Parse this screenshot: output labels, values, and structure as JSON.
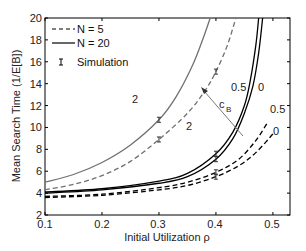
{
  "chart_data": {
    "type": "line",
    "title": "",
    "xlabel": "Initial Utilization ρ",
    "ylabel": "Mean Search Time (1/E[B])",
    "xlim": [
      0.1,
      0.53
    ],
    "ylim": [
      2,
      20
    ],
    "xticks": [
      "0.1",
      "0.2",
      "0.3",
      "0.4",
      "0.5"
    ],
    "yticks": [
      "2",
      "4",
      "6",
      "8",
      "10",
      "12",
      "14",
      "16",
      "18",
      "20"
    ],
    "grid": false,
    "legend_position": "upper left",
    "legend": [
      {
        "label": "N = 5",
        "style": "dashed"
      },
      {
        "label": "N = 20",
        "style": "solid"
      },
      {
        "label": "Simulation",
        "style": "errorbar"
      }
    ],
    "series": [
      {
        "name": "N = 20, cB = 2",
        "style": "solid",
        "color": "#707070",
        "x": [
          0.1,
          0.15,
          0.2,
          0.25,
          0.3,
          0.33,
          0.36,
          0.38,
          0.39
        ],
        "y": [
          5.0,
          5.7,
          6.8,
          8.4,
          10.7,
          12.8,
          15.8,
          18.5,
          20
        ]
      },
      {
        "name": "N = 5, cB = 2",
        "style": "dashed",
        "color": "#707070",
        "x": [
          0.1,
          0.15,
          0.2,
          0.25,
          0.3,
          0.35,
          0.38,
          0.4,
          0.42,
          0.435
        ],
        "y": [
          4.3,
          4.8,
          5.6,
          6.9,
          8.9,
          11.3,
          13.3,
          15.1,
          17.5,
          20
        ]
      },
      {
        "name": "N = 20, cB = 0.5",
        "style": "solid",
        "color": "#000000",
        "x": [
          0.1,
          0.2,
          0.3,
          0.35,
          0.4,
          0.43,
          0.45,
          0.46,
          0.47,
          0.475
        ],
        "y": [
          4.1,
          4.4,
          5.1,
          5.8,
          7.6,
          9.6,
          12.0,
          14.2,
          17.5,
          20
        ]
      },
      {
        "name": "N = 20, cB = 0",
        "style": "solid",
        "color": "#000000",
        "x": [
          0.1,
          0.2,
          0.3,
          0.35,
          0.4,
          0.43,
          0.45,
          0.465,
          0.475,
          0.482
        ],
        "y": [
          4.0,
          4.3,
          4.9,
          5.5,
          7.1,
          9.0,
          11.3,
          13.8,
          16.8,
          20
        ]
      },
      {
        "name": "N = 5, cB = 0.5",
        "style": "dashed",
        "color": "#000000",
        "x": [
          0.1,
          0.2,
          0.3,
          0.35,
          0.4,
          0.44,
          0.47,
          0.49
        ],
        "y": [
          3.7,
          3.9,
          4.5,
          5.0,
          5.9,
          7.1,
          8.8,
          10.4
        ]
      },
      {
        "name": "N = 5, cB = 0",
        "style": "dashed",
        "color": "#000000",
        "x": [
          0.1,
          0.2,
          0.3,
          0.35,
          0.4,
          0.44,
          0.47,
          0.5
        ],
        "y": [
          3.6,
          3.8,
          4.3,
          4.7,
          5.5,
          6.5,
          7.7,
          9.4
        ]
      }
    ],
    "simulation_points": [
      {
        "x": 0.3,
        "y": 10.7
      },
      {
        "x": 0.3,
        "y": 8.9
      },
      {
        "x": 0.4,
        "y": 15.1
      },
      {
        "x": 0.4,
        "y": 7.6
      },
      {
        "x": 0.4,
        "y": 7.1
      },
      {
        "x": 0.4,
        "y": 5.9
      },
      {
        "x": 0.4,
        "y": 5.5
      }
    ],
    "annotations": [
      {
        "text": "2",
        "x": 0.26,
        "y": 11.0,
        "note": "N=20 cB=2 curve label"
      },
      {
        "text": "2",
        "x": 0.325,
        "y": 8.3,
        "note": "N=5 cB=2 curve label"
      },
      {
        "text": "0.5",
        "x": 0.425,
        "y": 12.7,
        "note": "N=20 cB=0.5 curve label"
      },
      {
        "text": "0",
        "x": 0.468,
        "y": 12.7,
        "note": "N=20 cB=0 curve label"
      },
      {
        "text": "0.5",
        "x": 0.505,
        "y": 10.1,
        "note": "N=5 cB=0.5 curve label"
      },
      {
        "text": "0",
        "x": 0.505,
        "y": 8.1,
        "note": "N=5 cB=0 curve label"
      },
      {
        "text": "cB",
        "x": 0.385,
        "y": 11.3,
        "note": "arrow label: increasing cB"
      }
    ]
  },
  "labels": {
    "xlabel": "Initial Utilization ρ",
    "ylabel": "Mean Search Time (1/E[B])",
    "xticks": [
      "0.1",
      "0.2",
      "0.3",
      "0.4",
      "0.5"
    ],
    "yticks": [
      "2",
      "4",
      "6",
      "8",
      "10",
      "12",
      "14",
      "16",
      "18",
      "20"
    ],
    "legend_n5": "N = 5",
    "legend_n20": "N = 20",
    "legend_sim": "Simulation",
    "lbl_2a": "2",
    "lbl_2b": "2",
    "lbl_05a": "0.5",
    "lbl_0a": "0",
    "lbl_05b": "0.5",
    "lbl_0b": "0",
    "lbl_c": "c",
    "lbl_b": "B"
  }
}
